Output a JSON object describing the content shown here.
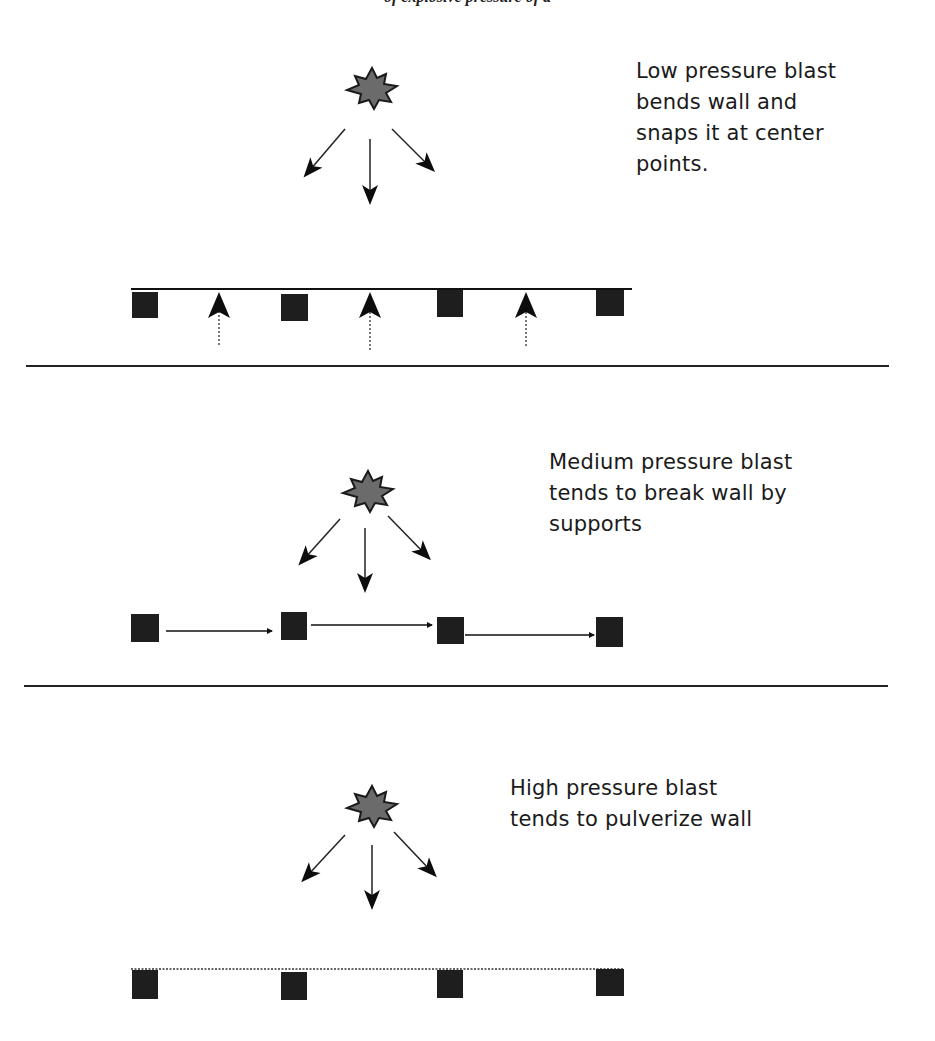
{
  "header": {
    "caption": "of explosive pressure of a"
  },
  "panels": [
    {
      "id": "low",
      "label_lines": [
        "Low pressure blast",
        "bends wall and",
        "snaps it at center",
        "points."
      ],
      "behavior": "bends-and-snaps-at-center"
    },
    {
      "id": "medium",
      "label_lines": [
        "Medium pressure blast",
        "tends to break wall by",
        "supports"
      ],
      "behavior": "breaks-at-supports"
    },
    {
      "id": "high",
      "label_lines": [
        "High pressure blast",
        "tends to pulverize wall"
      ],
      "behavior": "pulverizes"
    }
  ],
  "colors": {
    "blast_fill": "#6b6b6b",
    "support_fill": "#1e1e1e",
    "line": "#111111"
  }
}
